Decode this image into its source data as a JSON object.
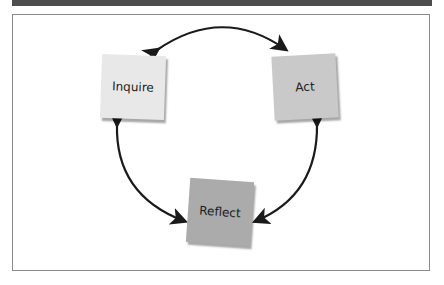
{
  "diagram": {
    "type": "cycle",
    "nodes": [
      {
        "id": "inquire",
        "label": "Inquire",
        "fill": "#e8e8e8"
      },
      {
        "id": "act",
        "label": "Act",
        "fill": "#c9c9c9"
      },
      {
        "id": "reflect",
        "label": "Reflect",
        "fill": "#ababab"
      }
    ],
    "edges": [
      {
        "from": "inquire",
        "to": "act",
        "bidirectional": true
      },
      {
        "from": "act",
        "to": "reflect",
        "bidirectional": true
      },
      {
        "from": "reflect",
        "to": "inquire",
        "bidirectional": true
      }
    ],
    "colors": {
      "header_bar": "#4d4d4d",
      "frame_border": "#8a8a8a",
      "arrow": "#1a1a1a"
    }
  }
}
